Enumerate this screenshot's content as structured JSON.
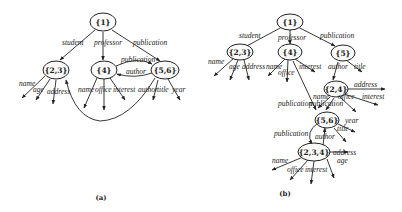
{
  "figure_a": {
    "caption": "(a)",
    "nodes": {
      "n1": "{1}",
      "n23": "{2,3}",
      "n4": "{4}",
      "n56": "{5,6}"
    },
    "edges": {
      "student": "student",
      "professor": "professor",
      "publication": "publication",
      "pub_4_56": "publication",
      "author_56_4": "author",
      "name23": "name",
      "age23": "age",
      "address23": "address",
      "name4": "name",
      "office4": "office",
      "interest4": "interest",
      "author56": "author",
      "title56": "title",
      "year56": "year"
    }
  },
  "figure_b": {
    "caption": "(b)",
    "nodes": {
      "n1": "{1}",
      "n23": "{2,3}",
      "n4": "{4}",
      "n5": "{5}",
      "n24": "{2,4}",
      "n56": "{5,6}",
      "n234": "{2,3,4}"
    },
    "edges": {
      "student": "student",
      "professor": "professor",
      "publication": "publication",
      "name23": "name",
      "age23": "age",
      "address23": "address",
      "name4": "name",
      "office4": "office",
      "interest4": "interest",
      "author5": "author",
      "title5": "title",
      "address24": "address",
      "name24": "name",
      "office24": "office",
      "interest24": "interest",
      "publication24a": "publication",
      "publication24b": "publication",
      "year56": "year",
      "title56": "title",
      "publication56": "publication",
      "author56": "author",
      "name234": "name",
      "office234": "office",
      "interest234": "interest",
      "address234": "address",
      "age234": "age"
    }
  }
}
